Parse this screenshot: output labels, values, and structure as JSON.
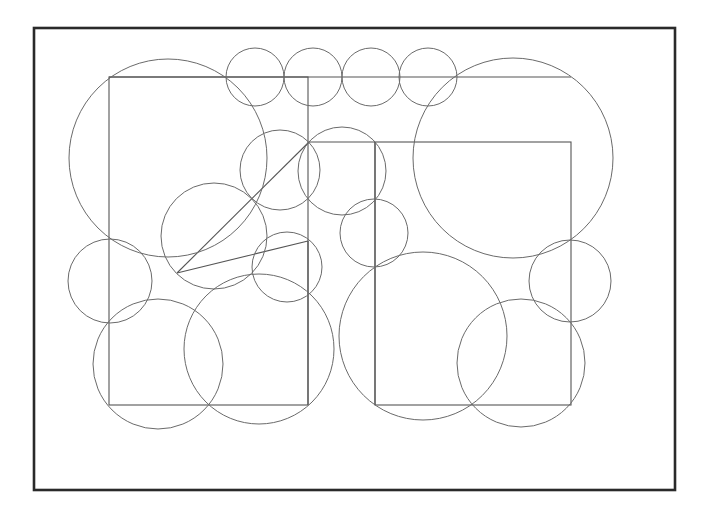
{
  "diagram": {
    "colors": {
      "background": "#ffffff",
      "frame": "#2a2a2a",
      "stroke": "#6a6a6a",
      "rect_stroke": "#555555"
    },
    "frame": {
      "x": 34,
      "y": 28,
      "width": 641,
      "height": 462
    },
    "rectangles": [
      {
        "name": "outer-left-rect",
        "x": 109,
        "y": 77,
        "width": 199,
        "height": 328
      },
      {
        "name": "outer-right-rect",
        "x": 375,
        "y": 142,
        "width": 196,
        "height": 263
      }
    ],
    "polylines": [
      {
        "name": "top-connector-line",
        "points": [
          [
            109,
            77
          ],
          [
            571,
            77
          ]
        ]
      },
      {
        "name": "right-rect-top-line",
        "points": [
          [
            309,
            142
          ],
          [
            375,
            142
          ]
        ]
      },
      {
        "name": "right-rect-left-line",
        "points": [
          [
            375,
            142
          ],
          [
            375,
            405
          ]
        ]
      },
      {
        "name": "diagonal-line",
        "points": [
          [
            177,
            273
          ],
          [
            309,
            142
          ]
        ]
      },
      {
        "name": "slant-line",
        "points": [
          [
            177,
            273
          ],
          [
            308,
            241
          ]
        ]
      },
      {
        "name": "left-rect-right-line",
        "points": [
          [
            308,
            241
          ],
          [
            308,
            405
          ]
        ]
      }
    ],
    "circles": [
      {
        "name": "big-upper-left-circle",
        "cx": 168,
        "cy": 158,
        "r": 99
      },
      {
        "name": "big-upper-right-circle",
        "cx": 513,
        "cy": 158,
        "r": 100
      },
      {
        "name": "top-row-circle-1",
        "cx": 255,
        "cy": 77,
        "r": 29
      },
      {
        "name": "top-row-circle-2",
        "cx": 313,
        "cy": 77,
        "r": 29
      },
      {
        "name": "top-row-circle-3",
        "cx": 371,
        "cy": 77,
        "r": 29
      },
      {
        "name": "top-row-circle-4",
        "cx": 428,
        "cy": 77,
        "r": 29
      },
      {
        "name": "mid-circle-a",
        "cx": 280,
        "cy": 170,
        "r": 40
      },
      {
        "name": "mid-circle-b",
        "cx": 342,
        "cy": 171,
        "r": 44
      },
      {
        "name": "mid-left-circle",
        "cx": 214,
        "cy": 236,
        "r": 53
      },
      {
        "name": "small-center-circle",
        "cx": 287,
        "cy": 267,
        "r": 35
      },
      {
        "name": "mid-right-small-circle",
        "cx": 374,
        "cy": 233,
        "r": 34
      },
      {
        "name": "left-edge-circle",
        "cx": 110,
        "cy": 281,
        "r": 42
      },
      {
        "name": "right-edge-circle",
        "cx": 570,
        "cy": 281,
        "r": 41
      },
      {
        "name": "lower-left-circle",
        "cx": 158,
        "cy": 364,
        "r": 65
      },
      {
        "name": "lower-middle-circle",
        "cx": 259,
        "cy": 349,
        "r": 75
      },
      {
        "name": "lower-center-big-circle",
        "cx": 423,
        "cy": 336,
        "r": 84
      },
      {
        "name": "lower-right-circle",
        "cx": 521,
        "cy": 363,
        "r": 64
      }
    ]
  }
}
